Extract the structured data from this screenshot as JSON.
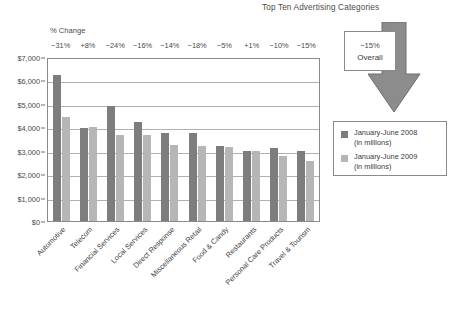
{
  "chart_data": {
    "type": "bar",
    "title": "Top Ten Advertising Categories",
    "xlabel": "",
    "ylabel": "",
    "ylim": [
      0,
      7000
    ],
    "ytick_labels": [
      "$7,000",
      "$6,000",
      "$5,000",
      "$4,000",
      "$3,000",
      "$2,000",
      "$1,000",
      "$0"
    ],
    "ytick_values": [
      7000,
      6000,
      5000,
      4000,
      3000,
      2000,
      1000,
      0
    ],
    "grid": true,
    "legend_position": "right",
    "categories": [
      "Automotive",
      "Telecom",
      "Financial Services",
      "Local Services",
      "Direct Response",
      "Miscellaneous Retail",
      "Food & Candy",
      "Restaurants",
      "Personal Care Products",
      "Travel & Tourism"
    ],
    "series": [
      {
        "name": "January-June 2008 (in millions)",
        "color": "#7d7d7d",
        "values": [
          6300,
          4000,
          4980,
          4300,
          3820,
          3820,
          3250,
          3030,
          3150,
          3030
        ]
      },
      {
        "name": "January-June 2009 (in millions)",
        "color": "#b6b6b6",
        "values": [
          4500,
          4080,
          3700,
          3700,
          3300,
          3220,
          3180,
          3020,
          2820,
          2600
        ]
      }
    ],
    "annotations": {
      "pct_change_header": "% Change",
      "pct_change": [
        "−31%",
        "+8%",
        "−24%",
        "−16%",
        "−14%",
        "−18%",
        "−5%",
        "+1%",
        "−10%",
        "−15%"
      ],
      "overall_pct": "−15%",
      "overall_label": "Overall"
    }
  },
  "legend": {
    "items": [
      {
        "label_line1": "January-June 2008",
        "label_line2": "(in millions)",
        "swatch": "series-2008-swatch"
      },
      {
        "label_line1": "January-June 2009",
        "label_line2": "(in millions)",
        "swatch": "series-2009-swatch"
      }
    ]
  },
  "colors": {
    "series_2008": "#7d7d7d",
    "series_2009": "#b6b6b6",
    "arrow": "#8c8c8c",
    "frame": "#8a8a8a",
    "grid": "#b0b0b0",
    "text": "#3a3a3a",
    "background": "#ffffff"
  }
}
